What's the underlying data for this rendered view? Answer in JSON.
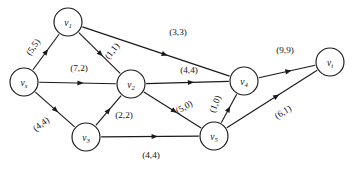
{
  "figure": {
    "type": "flow-network-diagram",
    "title": "",
    "background_color": "#ffffff",
    "stroke_color": "#1a1a1a",
    "label_color": "#111111",
    "width": 352,
    "height": 169,
    "label_format": "(capacity,flow)"
  },
  "nodes": [
    {
      "id": "vs",
      "label": "v",
      "subscript": "s",
      "x": 24,
      "y": 82,
      "r": 14
    },
    {
      "id": "v1",
      "label": "v",
      "subscript": "1",
      "x": 68,
      "y": 22,
      "r": 14
    },
    {
      "id": "v2",
      "label": "v",
      "subscript": "2",
      "x": 131,
      "y": 84,
      "r": 14
    },
    {
      "id": "v3",
      "label": "v",
      "subscript": "3",
      "x": 86,
      "y": 137,
      "r": 14
    },
    {
      "id": "v4",
      "label": "v",
      "subscript": "4",
      "x": 244,
      "y": 81,
      "r": 14
    },
    {
      "id": "v5",
      "label": "v",
      "subscript": "5",
      "x": 214,
      "y": 136,
      "r": 14
    },
    {
      "id": "vt",
      "label": "v",
      "subscript": "t",
      "x": 330,
      "y": 62,
      "r": 14
    }
  ],
  "edges": [
    {
      "id": "vs-v1",
      "from": "vs",
      "to": "v1",
      "label": "(5,5)",
      "capacity": 5,
      "flow": 5,
      "label_x": 33,
      "label_y": 47,
      "label_rotate": -55
    },
    {
      "id": "vs-v2",
      "from": "vs",
      "to": "v2",
      "label": "(7,2)",
      "capacity": 7,
      "flow": 2,
      "label_x": 79,
      "label_y": 68,
      "label_rotate": 0
    },
    {
      "id": "vs-v3",
      "from": "vs",
      "to": "v3",
      "label": "(4,4)",
      "capacity": 4,
      "flow": 4,
      "label_x": 41,
      "label_y": 124,
      "label_rotate": -37
    },
    {
      "id": "v1-v2",
      "from": "v1",
      "to": "v2",
      "label": "(1,1)",
      "capacity": 1,
      "flow": 1,
      "label_x": 112,
      "label_y": 51,
      "label_rotate": -52
    },
    {
      "id": "v1-v4",
      "from": "v1",
      "to": "v4",
      "label": "(3,3)",
      "capacity": 3,
      "flow": 3,
      "label_x": 178,
      "label_y": 32,
      "label_rotate": 0
    },
    {
      "id": "v2-v4",
      "from": "v2",
      "to": "v4",
      "label": "(4,4)",
      "capacity": 4,
      "flow": 4,
      "label_x": 189,
      "label_y": 70,
      "label_rotate": 0
    },
    {
      "id": "v2-v5",
      "from": "v2",
      "to": "v5",
      "label": "(5,0)",
      "capacity": 5,
      "flow": 0,
      "label_x": 184,
      "label_y": 107,
      "label_rotate": -29
    },
    {
      "id": "v3-v2",
      "from": "v3",
      "to": "v2",
      "label": "(2,2)",
      "capacity": 2,
      "flow": 2,
      "label_x": 124,
      "label_y": 115,
      "label_rotate": 0
    },
    {
      "id": "v3-v5",
      "from": "v3",
      "to": "v5",
      "label": "(4,4)",
      "capacity": 4,
      "flow": 4,
      "label_x": 151,
      "label_y": 155,
      "label_rotate": 0
    },
    {
      "id": "v5-v4",
      "from": "v5",
      "to": "v4",
      "label": "(1,0)",
      "capacity": 1,
      "flow": 0,
      "label_x": 215,
      "label_y": 104,
      "label_rotate": -68
    },
    {
      "id": "v4-vt",
      "from": "v4",
      "to": "vt",
      "label": "(9,9)",
      "capacity": 9,
      "flow": 9,
      "label_x": 285,
      "label_y": 50,
      "label_rotate": 0
    },
    {
      "id": "v5-vt",
      "from": "v5",
      "to": "vt",
      "label": "(6,1)",
      "capacity": 6,
      "flow": 1,
      "label_x": 283,
      "label_y": 112,
      "label_rotate": -32
    }
  ]
}
